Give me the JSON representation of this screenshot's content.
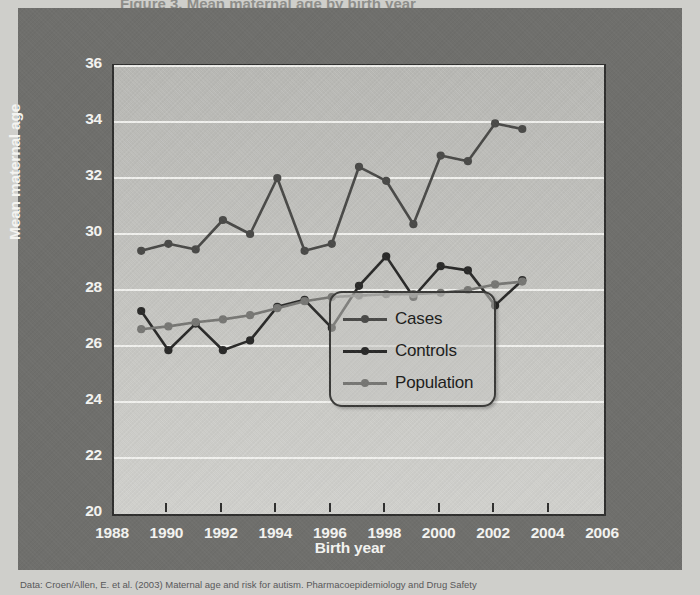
{
  "figure": {
    "title_sliver": "Figure 3. Mean maternal age by birth year",
    "caption": "Data: Croen/Allen, E. et al. (2003) Maternal age and risk for autism. Pharmacoepidemiology and Drug Safety"
  },
  "axes": {
    "y_title": "Mean maternal age",
    "x_title": "Birth year",
    "y_ticks": [
      "36",
      "34",
      "32",
      "30",
      "28",
      "26",
      "24",
      "22",
      "20"
    ],
    "x_ticks": [
      "1988",
      "1990",
      "1992",
      "1994",
      "1996",
      "1998",
      "2000",
      "2002",
      "2004",
      "2006"
    ]
  },
  "legend": {
    "position": "inside-lower-right",
    "items": [
      {
        "label": "Cases",
        "color": "#4a4a48"
      },
      {
        "label": "Controls",
        "color": "#2a2a29"
      },
      {
        "label": "Population",
        "color": "#777774"
      }
    ]
  },
  "colors": {
    "panel_background": "#6f6f6c",
    "plot_background": "#c4c4c0",
    "gridline": "#f2f2ef",
    "axis": "#2f2f2e",
    "tick_text": "#f4f4f1",
    "cases": "#4a4a48",
    "controls": "#2a2a29",
    "population": "#777774"
  },
  "chart_data": {
    "type": "line",
    "title": "Mean maternal age by birth year",
    "xlabel": "Birth year",
    "ylabel": "Mean maternal age",
    "xlim": [
      1988,
      2006
    ],
    "ylim": [
      20,
      36
    ],
    "xtick_step": 2,
    "ytick_step": 2,
    "grid": true,
    "legend_position": "inside-lower-right",
    "x": [
      1989,
      1990,
      1991,
      1992,
      1993,
      1994,
      1995,
      1996,
      1997,
      1998,
      1999,
      2000,
      2001,
      2002,
      2003,
      2004
    ],
    "series": [
      {
        "name": "Cases",
        "color": "#4a4a48",
        "marker": "circle",
        "values": [
          29.4,
          29.65,
          29.45,
          30.5,
          30.0,
          32.0,
          29.4,
          29.65,
          32.4,
          31.9,
          30.35,
          32.8,
          32.6,
          33.95,
          33.75,
          null
        ]
      },
      {
        "name": "Controls",
        "color": "#2a2a29",
        "marker": "circle",
        "values": [
          27.25,
          25.85,
          26.8,
          25.85,
          26.2,
          27.4,
          27.65,
          26.65,
          28.15,
          29.2,
          27.75,
          28.85,
          28.7,
          27.45,
          28.35,
          null
        ]
      },
      {
        "name": "Population",
        "color": "#777774",
        "marker": "circle",
        "values": [
          26.6,
          26.7,
          26.85,
          26.95,
          27.1,
          27.35,
          27.6,
          27.75,
          27.8,
          27.85,
          27.85,
          27.9,
          28.0,
          28.2,
          28.3,
          null
        ]
      }
    ]
  }
}
